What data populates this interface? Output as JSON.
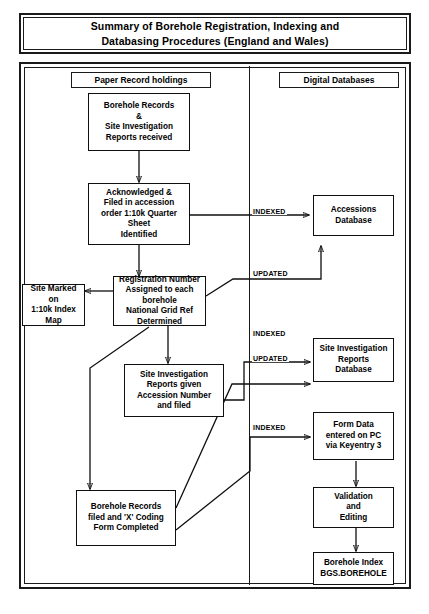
{
  "title": {
    "line1": "Summary of Borehole Registration, Indexing and",
    "line2": "Databasing Procedures (England and Wales)"
  },
  "columns": {
    "paper": "Paper Record holdings",
    "digital": "Digital Databases"
  },
  "nodes": {
    "borehole_records_received": "Borehole Records\n&\nSite Investigation\nReports received",
    "acknowledged_filed": "Acknowledged &\nFiled in accession\norder 1:10k Quarter\nSheet\nIdentified",
    "registration_number": "Registration Number\nAssigned to each\nborehole\nNational Grid Ref\nDetermined",
    "site_marked_map": "Site Marked on\n1:10k Index\nMap",
    "si_reports_accession": "Site Investigation\nReports given\nAccession Number\nand filed",
    "borehole_records_filed": "Borehole Records\nfiled and 'X' Coding\nForm Completed",
    "accessions_database": "Accessions\nDatabase",
    "si_reports_database": "Site Investigation\nReports\nDatabase",
    "form_data_entered": "Form Data\nentered on PC\nvia Keyentry 3",
    "validation_editing": "Validation\nand\nEditing",
    "borehole_index": "Borehole Index\nBGS.BOREHOLE"
  },
  "edge_labels": {
    "indexed_accessions": "INDEXED",
    "updated_accessions": "UPDATED",
    "indexed_si_reports": "INDEXED",
    "updated_si_reports": "UPDATED",
    "indexed_form_data": "INDEXED"
  },
  "colors": {
    "ink": "#0f0f0f",
    "paper": "#ffffff"
  }
}
